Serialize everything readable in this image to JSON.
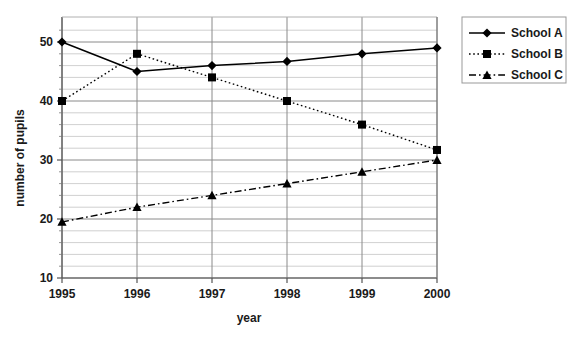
{
  "chart_data": {
    "type": "line",
    "title": "",
    "xlabel": "year",
    "ylabel": "number of pupils",
    "categories": [
      "1995",
      "1996",
      "1997",
      "1998",
      "1999",
      "2000"
    ],
    "x": [
      1995,
      1996,
      1997,
      1998,
      1999,
      2000
    ],
    "xlim": [
      1995,
      2000
    ],
    "ylim": [
      10,
      52
    ],
    "yticks": [
      10,
      20,
      30,
      40,
      50
    ],
    "ytick_labels": [
      "10",
      "20",
      "30",
      "40",
      "50"
    ],
    "yminor_step": 2,
    "grid": "horizontal-and-vertical",
    "legend_position": "right",
    "series": [
      {
        "name": "School A",
        "values": [
          50,
          45,
          46,
          46.7,
          48,
          49
        ],
        "marker": "diamond",
        "line_style": "solid",
        "color": "#000000"
      },
      {
        "name": "School B",
        "values": [
          40,
          48,
          44,
          40,
          36,
          31.7
        ],
        "marker": "square",
        "line_style": "dotted",
        "color": "#000000"
      },
      {
        "name": "School C",
        "values": [
          19.5,
          22,
          24,
          26,
          28,
          30
        ],
        "marker": "triangle",
        "line_style": "dash-dot",
        "color": "#000000"
      }
    ]
  },
  "axes": {
    "x_title": "year",
    "y_title": "number of pupils",
    "x_tick_labels": [
      "1995",
      "1996",
      "1997",
      "1998",
      "1999",
      "2000"
    ],
    "y_tick_labels": [
      "50",
      "40",
      "30",
      "20",
      "10"
    ]
  },
  "legend": {
    "entries": [
      {
        "label": "School A"
      },
      {
        "label": "School B"
      },
      {
        "label": "School C"
      }
    ]
  },
  "colors": {
    "line": "#000000",
    "grid": "#b0b0b0",
    "axis": "#555555",
    "text": "#1a1a1a",
    "background": "#ffffff"
  }
}
